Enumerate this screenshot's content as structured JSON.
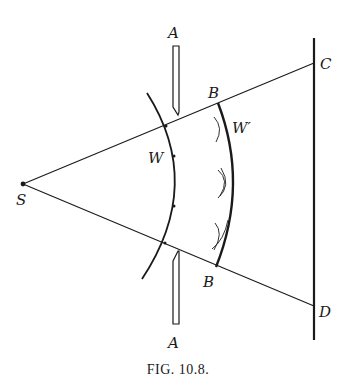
{
  "figure": {
    "caption": "Fig. 10.8.",
    "caption_display": "FIG. 10.8.",
    "labels": {
      "source": "S",
      "slit_top": "A",
      "slit_bottom": "A",
      "screen_top": "C",
      "screen_bottom": "D",
      "wavefront_initial": "W",
      "wavefront_later": "W′",
      "edge_top": "B",
      "edge_bottom": "B"
    },
    "elements": [
      {
        "name": "source-point",
        "label": "S",
        "description": "point source"
      },
      {
        "name": "aperture-screen",
        "label": "A",
        "description": "opaque plate with slit"
      },
      {
        "name": "wavefront-w",
        "label": "W",
        "description": "spherical wavefront at aperture with secondary source points"
      },
      {
        "name": "wavefront-w-prime",
        "label": "W′",
        "description": "later wavefront as envelope of secondary wavelets"
      },
      {
        "name": "observation-screen",
        "label": "CD",
        "description": "screen"
      },
      {
        "name": "ray-upper",
        "from": "S",
        "to": "C"
      },
      {
        "name": "ray-lower",
        "from": "S",
        "to": "D"
      }
    ],
    "colors": {
      "ink": "#1a1a1a",
      "paper": "#ffffff"
    }
  }
}
